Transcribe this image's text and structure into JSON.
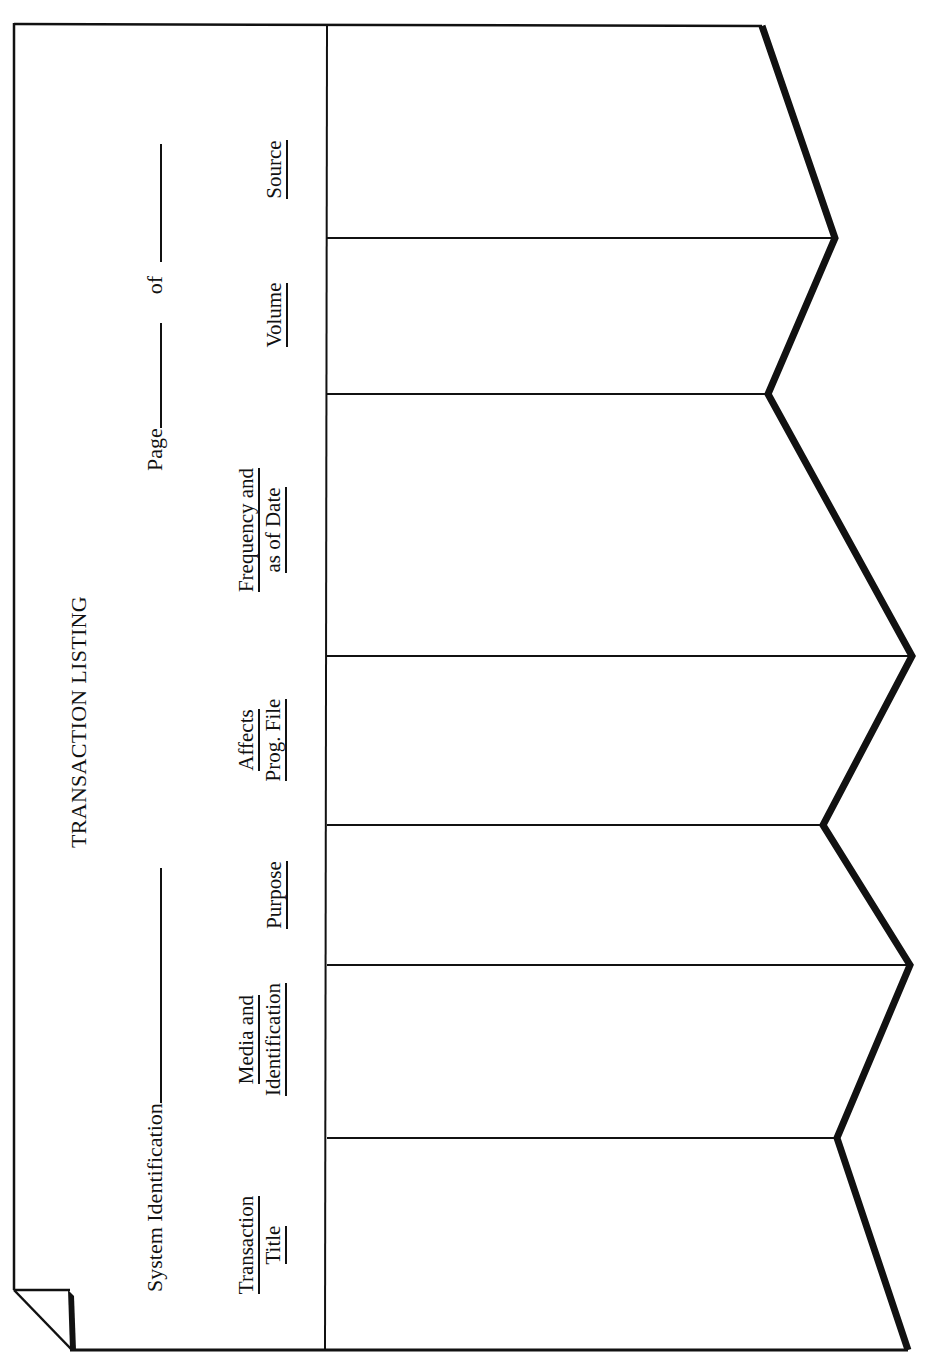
{
  "form": {
    "title": "TRANSACTION LISTING",
    "system_identification_label": "System Identification",
    "system_identification_value": "",
    "page_label": "Page",
    "page_value": "",
    "of_label": "of",
    "of_value": ""
  },
  "columns": [
    {
      "id": "transaction-title",
      "lines": [
        "Transaction",
        "Title"
      ]
    },
    {
      "id": "media-identification",
      "lines": [
        "Media and",
        "Identification"
      ]
    },
    {
      "id": "purpose",
      "lines": [
        "Purpose"
      ]
    },
    {
      "id": "affects-prog-file",
      "lines": [
        "Affects",
        "Prog. File"
      ]
    },
    {
      "id": "frequency-as-of-date",
      "lines": [
        "Frequency and",
        "as of Date"
      ]
    },
    {
      "id": "volume",
      "lines": [
        "Volume"
      ]
    },
    {
      "id": "source",
      "lines": [
        "Source"
      ]
    }
  ],
  "rows": [
    {
      "column": "transaction-title",
      "value": ""
    },
    {
      "column": "media-identification",
      "value": ""
    },
    {
      "column": "purpose",
      "value": ""
    },
    {
      "column": "affects-prog-file",
      "value": ""
    },
    {
      "column": "frequency-as-of-date",
      "value": ""
    },
    {
      "column": "volume",
      "value": ""
    },
    {
      "column": "source",
      "value": ""
    }
  ],
  "colors": {
    "ink": "#111111",
    "paper": "#ffffff"
  }
}
